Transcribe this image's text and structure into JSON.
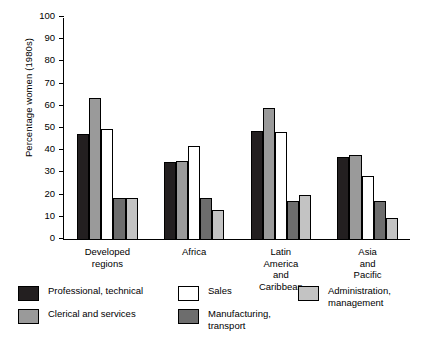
{
  "chart_data": {
    "type": "bar",
    "title": "",
    "xlabel": "",
    "ylabel": "Percentage women (1980s)",
    "ylim": [
      0,
      100
    ],
    "ytick_step": 10,
    "yticks": [
      "0",
      "10",
      "20",
      "30",
      "40",
      "50",
      "60",
      "70",
      "80",
      "90",
      "100"
    ],
    "grid": false,
    "legend_position": "bottom",
    "categories": [
      "Developed\nregions",
      "Africa",
      "Latin America\nand Caribbean",
      "Asia and Pacific"
    ],
    "series": [
      {
        "name": "Professional, technical",
        "color": "#231f20",
        "values": [
          47.5,
          34.5,
          48.5,
          37.0
        ]
      },
      {
        "name": "Clerical and services",
        "color": "#9a9a9a",
        "values": [
          63.5,
          35.0,
          59.0,
          38.0
        ]
      },
      {
        "name": "Sales",
        "color": "#ffffff",
        "values": [
          49.5,
          42.0,
          48.0,
          28.5
        ]
      },
      {
        "name": "Manufacturing,\ntransport",
        "color": "#6d6d6d",
        "values": [
          18.5,
          18.5,
          17.0,
          17.0
        ]
      },
      {
        "name": "Administration,\nmanagement",
        "color": "#c3c3c3",
        "values": [
          18.5,
          13.0,
          20.0,
          9.5
        ]
      }
    ]
  },
  "legend": {
    "items": [
      {
        "label": "Professional, technical",
        "swatch": "legend-swatch-professional"
      },
      {
        "label": "Clerical and services",
        "swatch": "legend-swatch-clerical"
      },
      {
        "label": "Sales",
        "swatch": "legend-swatch-sales"
      },
      {
        "label": "Manufacturing,\ntransport",
        "swatch": "legend-swatch-manufacturing"
      },
      {
        "label": "Administration,\nmanagement",
        "swatch": "legend-swatch-administration"
      }
    ]
  }
}
